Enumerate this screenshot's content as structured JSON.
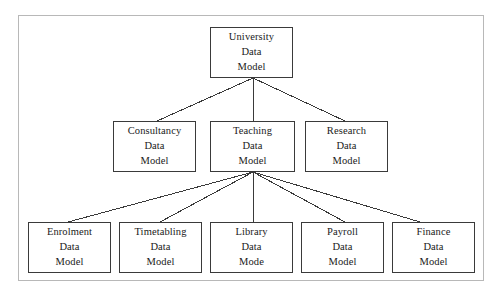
{
  "diagram": {
    "type": "hierarchy-tree",
    "frame": {
      "stroke": "#b8b8b8"
    },
    "box_stroke": "#3a3a3a",
    "connector_stroke": "#3a3a3a",
    "background": "#ffffff",
    "levels": [
      {
        "level": 1,
        "nodes": [
          {
            "id": "university",
            "lines": [
              "University",
              "Data",
              "Model"
            ],
            "x": 210,
            "y": 27,
            "w": 83,
            "h": 51
          }
        ]
      },
      {
        "level": 2,
        "nodes": [
          {
            "id": "consultancy",
            "lines": [
              "Consultancy",
              "Data",
              "Model"
            ],
            "x": 113,
            "y": 121,
            "w": 83,
            "h": 51
          },
          {
            "id": "teaching",
            "lines": [
              "Teaching",
              "Data",
              "Model"
            ],
            "x": 210,
            "y": 121,
            "w": 85,
            "h": 51
          },
          {
            "id": "research",
            "lines": [
              "Research",
              "Data",
              "Model"
            ],
            "x": 305,
            "y": 121,
            "w": 83,
            "h": 51
          }
        ]
      },
      {
        "level": 3,
        "nodes": [
          {
            "id": "enrolment",
            "lines": [
              "Enrolment",
              "Data",
              "Model"
            ],
            "x": 28,
            "y": 222,
            "w": 83,
            "h": 51
          },
          {
            "id": "timetabling",
            "lines": [
              "Timetabling",
              "Data",
              "Model"
            ],
            "x": 119,
            "y": 222,
            "w": 83,
            "h": 51
          },
          {
            "id": "library",
            "lines": [
              "Library",
              "Data",
              "Mode"
            ],
            "x": 210,
            "y": 222,
            "w": 83,
            "h": 51
          },
          {
            "id": "payroll",
            "lines": [
              "Payroll",
              "Data",
              "Model"
            ],
            "x": 301,
            "y": 222,
            "w": 83,
            "h": 51
          },
          {
            "id": "finance",
            "lines": [
              "Finance",
              "Data",
              "Model"
            ],
            "x": 392,
            "y": 222,
            "w": 83,
            "h": 51
          }
        ]
      }
    ],
    "edges": [
      {
        "from": "university",
        "to": "consultancy",
        "x1": 253,
        "y1": 78,
        "x2": 157,
        "y2": 121
      },
      {
        "from": "university",
        "to": "teaching",
        "x1": 253,
        "y1": 78,
        "x2": 253,
        "y2": 121
      },
      {
        "from": "university",
        "to": "research",
        "x1": 253,
        "y1": 78,
        "x2": 345,
        "y2": 121
      },
      {
        "from": "teaching",
        "to": "enrolment",
        "x1": 253,
        "y1": 172,
        "x2": 68,
        "y2": 222
      },
      {
        "from": "teaching",
        "to": "timetabling",
        "x1": 253,
        "y1": 172,
        "x2": 160,
        "y2": 222
      },
      {
        "from": "teaching",
        "to": "library",
        "x1": 253,
        "y1": 172,
        "x2": 253,
        "y2": 222
      },
      {
        "from": "teaching",
        "to": "payroll",
        "x1": 253,
        "y1": 172,
        "x2": 345,
        "y2": 222
      },
      {
        "from": "teaching",
        "to": "finance",
        "x1": 253,
        "y1": 172,
        "x2": 420,
        "y2": 222
      }
    ]
  }
}
